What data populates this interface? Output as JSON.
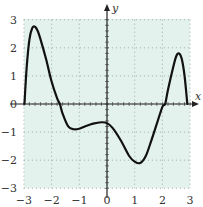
{
  "chart_data": {
    "type": "line",
    "title": "",
    "xlabel": "x",
    "ylabel": "y",
    "xlim": [
      -3,
      3
    ],
    "ylim": [
      -3,
      3
    ],
    "grid": true,
    "legend": null,
    "x_ticks": [
      "−3",
      "−2",
      "−1",
      "0",
      "1",
      "2",
      "3"
    ],
    "y_ticks": [
      "3",
      "2",
      "1",
      "0",
      "−1",
      "−2",
      "−3"
    ],
    "series": [
      {
        "name": "f(x)",
        "x": [
          -2.98,
          -2.9,
          -2.8,
          -2.7,
          -2.6,
          -2.5,
          -2.4,
          -2.2,
          -2.0,
          -1.8,
          -1.7,
          -1.6,
          -1.4,
          -1.2,
          -1.0,
          -0.8,
          -0.5,
          -0.2,
          0.0,
          0.2,
          0.5,
          0.8,
          1.0,
          1.2,
          1.4,
          1.6,
          1.8,
          2.0,
          2.1,
          2.2,
          2.4,
          2.5,
          2.6,
          2.7,
          2.8,
          2.9
        ],
        "y": [
          0.0,
          1.3,
          2.3,
          2.7,
          2.75,
          2.6,
          2.3,
          1.6,
          0.8,
          0.2,
          0.0,
          -0.35,
          -0.8,
          -0.9,
          -0.88,
          -0.8,
          -0.7,
          -0.65,
          -0.68,
          -0.85,
          -1.3,
          -1.85,
          -2.05,
          -2.1,
          -1.85,
          -1.3,
          -0.7,
          -0.1,
          0.0,
          0.5,
          1.35,
          1.7,
          1.8,
          1.6,
          1.0,
          0.0
        ]
      }
    ],
    "annotations": []
  },
  "colors": {
    "background_fill": "#e4f2ee",
    "curve": "#111111",
    "axis": "#222222",
    "grid": "#8a9a94"
  }
}
